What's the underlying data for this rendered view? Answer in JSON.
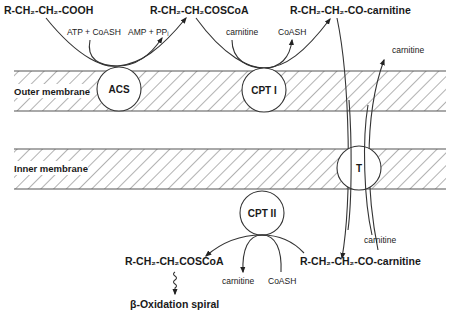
{
  "diagram": {
    "membranes": {
      "outer": {
        "label": "Outer membrane"
      },
      "inner": {
        "label": "Inner membrane"
      }
    },
    "enzymes": {
      "acs": "ACS",
      "cpt1": "CPT I",
      "cpt2": "CPT II",
      "translocase": "T"
    },
    "molecules": {
      "fatty_acid": "R-CH₂-CH₂-COOH",
      "acyl_coa_out": "R-CH₂-CH₂COSCoA",
      "acyl_carnitine_out": "R-CH₂-CH₂-CO-carnitine",
      "acyl_carnitine_in": "R-CH₂-CH₂-CO-carnitine",
      "acyl_coa_in": "R-CH₂-CH₂COSCoA",
      "beta_oxidation": "β-Oxidation spiral"
    },
    "cofactors": {
      "acs_in": "ATP + CoASH",
      "acs_out": "AMP + PPᵢ",
      "cpt1_in": "carnitine",
      "cpt1_out": "CoASH",
      "carnitine_return_top": "carnitine",
      "carnitine_return_bottom": "carnitine",
      "cpt2_out_carnitine": "carnitine",
      "cpt2_in_coash": "CoASH"
    }
  }
}
